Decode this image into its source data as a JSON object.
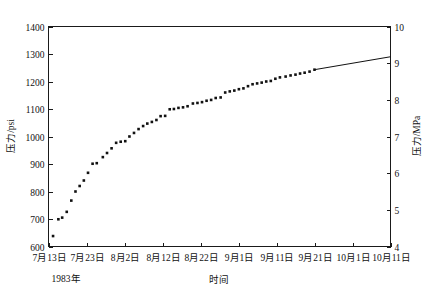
{
  "chart_data": {
    "type": "scatter",
    "title": "",
    "xlabel": "时间",
    "ylabel": "压力/psi",
    "ylabel_right": "压力/MPa",
    "year_note": "1983年",
    "grid": false,
    "legend": null,
    "xlim": [
      0,
      90
    ],
    "ylim": [
      600,
      1400
    ],
    "ylim_right": [
      4,
      10
    ],
    "xtick_labels": [
      "7月13日",
      "7月23日",
      "8月2日",
      "8月12日",
      "8月22日",
      "9月1日",
      "9月11日",
      "9月21日",
      "10月1日",
      "10月11日"
    ],
    "xtick_values": [
      0,
      10,
      20,
      30,
      40,
      50,
      60,
      70,
      80,
      90
    ],
    "ytick_labels": [
      "600",
      "700",
      "800",
      "900",
      "1000",
      "1100",
      "1200",
      "1300",
      "1400"
    ],
    "ytick_values": [
      600,
      700,
      800,
      900,
      1000,
      1100,
      1200,
      1300,
      1400
    ],
    "ytick_right_labels": [
      "4",
      "5",
      "6",
      "7",
      "8",
      "9",
      "10"
    ],
    "ytick_right_values": [
      4,
      5,
      6,
      7,
      8,
      9,
      10
    ],
    "x": [
      1.2,
      2.6,
      3.6,
      4.8,
      6.0,
      7.1,
      8.2,
      9.3,
      10.4,
      11.6,
      12.7,
      14.3,
      15.4,
      16.6,
      17.8,
      19.0,
      20.2,
      21.3,
      22.5,
      23.7,
      24.9,
      26.0,
      27.2,
      28.4,
      29.5,
      30.7,
      31.9,
      33.0,
      34.2,
      35.4,
      36.6,
      38.0,
      39.2,
      40.4,
      41.6,
      42.8,
      44.0,
      45.3,
      46.5,
      47.7,
      48.9,
      50.1,
      51.3,
      52.5,
      53.7,
      54.9,
      56.1,
      57.3,
      58.5,
      59.7,
      60.9,
      62.4,
      63.7,
      65.0,
      66.2,
      67.4,
      68.7,
      70.0
    ],
    "y": [
      638,
      699,
      705,
      726,
      767,
      800,
      820,
      840,
      868,
      901,
      903,
      925,
      940,
      957,
      977,
      981,
      983,
      1000,
      1013,
      1027,
      1038,
      1047,
      1053,
      1060,
      1074,
      1075,
      1099,
      1100,
      1104,
      1106,
      1110,
      1120,
      1122,
      1125,
      1130,
      1133,
      1140,
      1142,
      1160,
      1164,
      1167,
      1172,
      1175,
      1183,
      1190,
      1193,
      1196,
      1200,
      1202,
      1210,
      1215,
      1218,
      1222,
      1225,
      1229,
      1232,
      1236,
      1243
    ],
    "trend_line": {
      "x_start": 70.0,
      "y_start": 1243,
      "x_end": 90.0,
      "y_end": 1290
    },
    "marker": "square",
    "marker_size": 2.6,
    "marker_color": "#111111"
  }
}
